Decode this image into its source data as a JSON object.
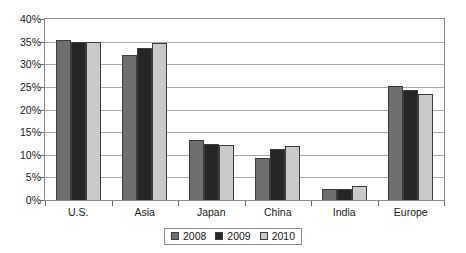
{
  "chart_data": {
    "type": "bar",
    "title": "",
    "subtitle": "",
    "xlabel": "",
    "ylabel": "",
    "categories": [
      "U.S.",
      "Asia",
      "Japan",
      "China",
      "India",
      "Europe"
    ],
    "series": [
      {
        "name": "2008",
        "color": "#6e6e6e",
        "values": [
          35.4,
          32.0,
          13.2,
          9.2,
          2.4,
          25.3
        ]
      },
      {
        "name": "2009",
        "color": "#262626",
        "values": [
          35.0,
          33.5,
          12.3,
          11.2,
          2.5,
          24.4
        ]
      },
      {
        "name": "2010",
        "color": "#c9c9c9",
        "values": [
          34.9,
          34.7,
          12.1,
          12.0,
          3.0,
          23.5
        ]
      }
    ],
    "ylim": [
      0,
      40
    ],
    "ytick_step": 5,
    "ytick_labels": [
      "0%",
      "5%",
      "10%",
      "15%",
      "20%",
      "25%",
      "30%",
      "35%",
      "40%"
    ],
    "ytick_values": [
      0,
      5,
      10,
      15,
      20,
      25,
      30,
      35,
      40
    ],
    "grid": true,
    "grid_axis": "y",
    "legend": true,
    "legend_position": "bottom",
    "legend_entries": [
      "2008",
      "2009",
      "2010"
    ],
    "value_suffix": "%",
    "background_color": "#ffffff",
    "plot_border_color": "#8c8c8c",
    "gridline_color": "#aaaaaa",
    "bar_border_color": "#3d3d3d",
    "text_color": "#1a1a1a"
  }
}
